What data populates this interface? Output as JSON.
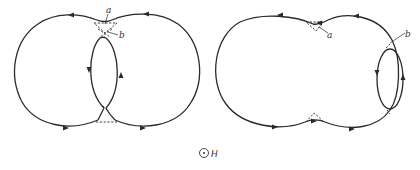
{
  "figure": {
    "panels": [
      {
        "id": "left",
        "description": "Two overlapping circular orbits with opposite-direction inner lens orbit; magnetic breakdown junctions marked",
        "labels": {
          "a": "a",
          "b": "b"
        }
      },
      {
        "id": "right",
        "description": "Combined peanut-shaped outer orbit with small separate elliptical orbit on right side",
        "labels": {
          "a": "a",
          "b": "b"
        }
      }
    ],
    "field": {
      "symbol": "circle-dot",
      "label": "H"
    },
    "colors": {
      "stroke": "#2a2a2a",
      "background": "#ffffff"
    }
  }
}
